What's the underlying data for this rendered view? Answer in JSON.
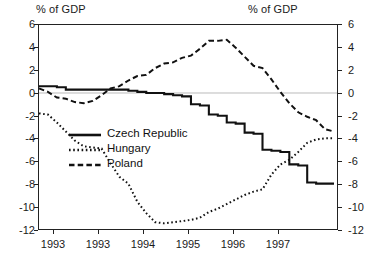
{
  "chart_data": {
    "type": "line",
    "title": "",
    "subtitle": "",
    "xlabel": "",
    "ylabel": "% of GDP",
    "ylabel_right": "% of GDP",
    "ylim": [
      -12,
      6
    ],
    "yticks": [
      6,
      4,
      2,
      0,
      -2,
      -4,
      -6,
      -8,
      -10,
      -12
    ],
    "ytick_labels": [
      "6",
      "4",
      "2",
      "0",
      "-2",
      "-4",
      "-6",
      "-8",
      "-10",
      "-12"
    ],
    "grid": false,
    "zero_line": true,
    "legend_position": "center-left-inside",
    "xlim": [
      1992.75,
      1997.75
    ],
    "xticks": [
      1993.0,
      1993.75,
      1994.5,
      1995.25,
      1996.0,
      1996.75
    ],
    "xtick_labels": [
      "1993",
      "1993",
      "1994",
      "1995",
      "1996",
      "1997"
    ],
    "x": [
      1992.75,
      1992.9,
      1993.05,
      1993.2,
      1993.35,
      1993.5,
      1993.65,
      1993.8,
      1993.95,
      1994.1,
      1994.25,
      1994.4,
      1994.55,
      1994.7,
      1994.85,
      1995.0,
      1995.15,
      1995.3,
      1995.45,
      1995.6,
      1995.75,
      1995.9,
      1996.05,
      1996.2,
      1996.35,
      1996.5,
      1996.65,
      1996.8,
      1996.95,
      1997.1,
      1997.25,
      1997.4,
      1997.55,
      1997.7
    ],
    "series": [
      {
        "name": "Czech Republic",
        "style": "solid",
        "color": "#111111",
        "values": [
          0.6,
          0.6,
          0.5,
          0.3,
          0.3,
          0.3,
          0.3,
          0.3,
          0.3,
          0.3,
          0.2,
          0.1,
          0.0,
          0.0,
          -0.1,
          -0.2,
          -0.3,
          -1.0,
          -1.1,
          -1.9,
          -2.0,
          -2.6,
          -2.7,
          -3.5,
          -3.6,
          -5.0,
          -5.1,
          -5.2,
          -6.3,
          -6.4,
          -7.9,
          -8.0,
          -8.0,
          -8.0
        ]
      },
      {
        "name": "Hungary",
        "style": "dotted",
        "color": "#111111",
        "values": [
          -1.8,
          -1.9,
          -2.6,
          -3.4,
          -4.2,
          -4.7,
          -4.8,
          -4.9,
          -6.2,
          -7.4,
          -8.0,
          -9.6,
          -10.6,
          -11.4,
          -11.5,
          -11.4,
          -11.3,
          -11.2,
          -11.0,
          -10.5,
          -10.2,
          -9.8,
          -9.4,
          -9.0,
          -8.7,
          -8.5,
          -7.2,
          -6.3,
          -5.9,
          -5.2,
          -4.4,
          -4.1,
          -4.0,
          -4.0
        ]
      },
      {
        "name": "Poland",
        "style": "dashed",
        "color": "#111111",
        "values": [
          0.4,
          0.1,
          -0.4,
          -0.5,
          -0.8,
          -0.9,
          -0.7,
          -0.2,
          0.4,
          0.6,
          1.1,
          1.5,
          1.6,
          2.2,
          2.6,
          2.7,
          3.1,
          3.3,
          3.9,
          4.6,
          4.6,
          4.7,
          4.0,
          3.2,
          2.4,
          2.2,
          1.2,
          0.1,
          -0.9,
          -1.7,
          -2.1,
          -2.4,
          -3.2,
          -3.4
        ]
      }
    ]
  },
  "captions": {
    "top_left": "% of GDP",
    "top_right": "% of GDP"
  },
  "legend": {
    "items": [
      {
        "label": "Czech Republic",
        "style": "solid"
      },
      {
        "label": "Hungary",
        "style": "dotted"
      },
      {
        "label": "Poland",
        "style": "dashed"
      }
    ]
  },
  "colors": {
    "ink": "#111111",
    "frame": "#222222",
    "zero_line": "#b9b9b9",
    "background": "#ffffff"
  }
}
